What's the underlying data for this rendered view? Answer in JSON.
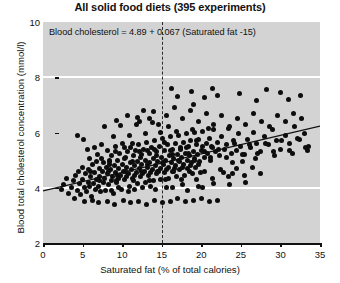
{
  "chart_data": {
    "type": "scatter",
    "title": "All solid food diets (395 experiments)",
    "xlabel": "Saturated fat (% of total calories)",
    "ylabel": "Blood total cholesterol concentration (mmol/l)",
    "xlim": [
      0,
      35
    ],
    "ylim": [
      2,
      10
    ],
    "xticks": [
      0,
      5,
      10,
      15,
      20,
      25,
      30,
      35
    ],
    "yticks": [
      2,
      4,
      6,
      8,
      10
    ],
    "gridlines_y": [
      4,
      8
    ],
    "grid": "horizontal-white",
    "legend": "none",
    "n_points": 395,
    "annotation": "Blood cholesterol = 4.89 + 0.067 (Saturated fat -15)",
    "regression": {
      "intercept_at_15": 4.89,
      "slope": 0.067,
      "x_start": 0,
      "y_start": 3.885,
      "x_end": 35,
      "y_end": 6.23
    },
    "reference_line": {
      "orientation": "vertical",
      "x": 15,
      "style": "dashed"
    },
    "point_color": "#0d0d0d",
    "plot_background": "#d3d3d3",
    "gridline_color": "#ffffff",
    "points": [
      [
        2.3,
        3.95
      ],
      [
        2.6,
        4.1
      ],
      [
        3.0,
        4.35
      ],
      [
        3.2,
        3.8
      ],
      [
        3.6,
        4.0
      ],
      [
        3.9,
        4.25
      ],
      [
        4.0,
        3.6
      ],
      [
        4.1,
        4.45
      ],
      [
        4.3,
        3.9
      ],
      [
        4.5,
        4.6
      ],
      [
        4.6,
        4.15
      ],
      [
        4.8,
        3.75
      ],
      [
        5.0,
        4.3
      ],
      [
        5.1,
        5.75
      ],
      [
        5.2,
        4.0
      ],
      [
        5.4,
        4.5
      ],
      [
        5.5,
        3.85
      ],
      [
        5.7,
        4.2
      ],
      [
        5.8,
        4.65
      ],
      [
        5.9,
        4.05
      ],
      [
        6.0,
        4.4
      ],
      [
        6.1,
        3.7
      ],
      [
        6.3,
        4.85
      ],
      [
        6.4,
        4.15
      ],
      [
        6.5,
        4.55
      ],
      [
        6.6,
        3.95
      ],
      [
        6.8,
        4.3
      ],
      [
        6.9,
        5.2
      ],
      [
        7.0,
        4.05
      ],
      [
        7.1,
        4.7
      ],
      [
        7.2,
        4.4
      ],
      [
        7.3,
        3.85
      ],
      [
        7.4,
        5.05
      ],
      [
        7.5,
        4.6
      ],
      [
        7.6,
        4.2
      ],
      [
        7.7,
        4.9
      ],
      [
        7.8,
        4.35
      ],
      [
        7.9,
        3.9
      ],
      [
        8.0,
        4.75
      ],
      [
        8.1,
        5.35
      ],
      [
        8.2,
        4.5
      ],
      [
        8.3,
        4.1
      ],
      [
        8.4,
        4.95
      ],
      [
        8.5,
        4.65
      ],
      [
        8.6,
        4.25
      ],
      [
        8.7,
        5.15
      ],
      [
        8.8,
        4.4
      ],
      [
        8.9,
        3.8
      ],
      [
        9.0,
        4.8
      ],
      [
        9.1,
        5.5
      ],
      [
        9.2,
        4.55
      ],
      [
        9.3,
        4.2
      ],
      [
        9.4,
        5.0
      ],
      [
        9.5,
        4.7
      ],
      [
        9.6,
        4.35
      ],
      [
        9.7,
        5.25
      ],
      [
        9.8,
        4.45
      ],
      [
        9.9,
        3.95
      ],
      [
        10.0,
        4.85
      ],
      [
        10.1,
        5.6
      ],
      [
        10.2,
        4.6
      ],
      [
        10.3,
        4.3
      ],
      [
        10.4,
        5.1
      ],
      [
        10.5,
        4.75
      ],
      [
        10.6,
        4.4
      ],
      [
        10.7,
        5.3
      ],
      [
        10.8,
        4.5
      ],
      [
        10.9,
        4.05
      ],
      [
        11.0,
        4.9
      ],
      [
        11.1,
        5.45
      ],
      [
        11.2,
        4.65
      ],
      [
        11.3,
        4.35
      ],
      [
        11.4,
        5.15
      ],
      [
        11.5,
        4.8
      ],
      [
        11.6,
        4.45
      ],
      [
        11.7,
        5.35
      ],
      [
        11.8,
        4.55
      ],
      [
        11.9,
        4.15
      ],
      [
        12.0,
        4.95
      ],
      [
        12.1,
        5.55
      ],
      [
        12.2,
        4.7
      ],
      [
        12.3,
        4.4
      ],
      [
        12.4,
        5.2
      ],
      [
        12.5,
        4.85
      ],
      [
        12.6,
        4.5
      ],
      [
        12.7,
        5.4
      ],
      [
        12.8,
        4.6
      ],
      [
        12.9,
        4.2
      ],
      [
        13.0,
        5.0
      ],
      [
        13.1,
        5.65
      ],
      [
        13.2,
        4.75
      ],
      [
        13.3,
        4.45
      ],
      [
        13.4,
        5.25
      ],
      [
        13.5,
        4.9
      ],
      [
        13.6,
        4.55
      ],
      [
        13.7,
        5.45
      ],
      [
        13.8,
        4.65
      ],
      [
        13.9,
        4.25
      ],
      [
        14.0,
        5.05
      ],
      [
        14.1,
        5.7
      ],
      [
        14.2,
        4.8
      ],
      [
        14.3,
        4.5
      ],
      [
        14.4,
        5.3
      ],
      [
        14.5,
        4.95
      ],
      [
        14.6,
        4.6
      ],
      [
        14.7,
        5.5
      ],
      [
        14.8,
        4.7
      ],
      [
        14.9,
        4.3
      ],
      [
        15.0,
        5.1
      ],
      [
        15.1,
        5.8
      ],
      [
        15.2,
        4.85
      ],
      [
        15.3,
        4.55
      ],
      [
        15.4,
        5.35
      ],
      [
        15.5,
        5.0
      ],
      [
        15.6,
        4.65
      ],
      [
        15.7,
        5.55
      ],
      [
        15.8,
        4.75
      ],
      [
        15.9,
        4.35
      ],
      [
        16.0,
        5.15
      ],
      [
        16.1,
        5.85
      ],
      [
        16.2,
        4.9
      ],
      [
        16.3,
        4.6
      ],
      [
        16.4,
        5.4
      ],
      [
        16.5,
        5.05
      ],
      [
        16.6,
        4.7
      ],
      [
        16.7,
        5.6
      ],
      [
        16.8,
        4.8
      ],
      [
        16.9,
        4.4
      ],
      [
        17.0,
        5.2
      ],
      [
        17.1,
        5.9
      ],
      [
        17.2,
        4.95
      ],
      [
        17.3,
        4.65
      ],
      [
        17.4,
        5.45
      ],
      [
        17.5,
        5.1
      ],
      [
        17.6,
        4.75
      ],
      [
        17.7,
        5.65
      ],
      [
        17.8,
        4.85
      ],
      [
        17.9,
        4.45
      ],
      [
        18.0,
        5.25
      ],
      [
        18.1,
        5.95
      ],
      [
        18.2,
        5.0
      ],
      [
        18.3,
        4.7
      ],
      [
        18.4,
        5.5
      ],
      [
        18.5,
        5.15
      ],
      [
        18.6,
        4.8
      ],
      [
        18.7,
        5.7
      ],
      [
        18.8,
        4.9
      ],
      [
        18.9,
        4.5
      ],
      [
        19.0,
        5.3
      ],
      [
        19.1,
        6.0
      ],
      [
        19.2,
        5.05
      ],
      [
        19.3,
        4.75
      ],
      [
        19.4,
        5.55
      ],
      [
        19.5,
        5.2
      ],
      [
        19.6,
        4.85
      ],
      [
        19.7,
        5.75
      ],
      [
        19.8,
        4.95
      ],
      [
        19.9,
        4.55
      ],
      [
        20.0,
        5.35
      ],
      [
        20.2,
        6.05
      ],
      [
        20.4,
        5.1
      ],
      [
        20.6,
        5.6
      ],
      [
        20.8,
        5.25
      ],
      [
        21.0,
        5.8
      ],
      [
        21.2,
        5.0
      ],
      [
        21.4,
        5.45
      ],
      [
        21.6,
        6.1
      ],
      [
        21.8,
        5.3
      ],
      [
        22.0,
        5.65
      ],
      [
        22.3,
        5.15
      ],
      [
        22.6,
        5.85
      ],
      [
        22.9,
        5.4
      ],
      [
        23.2,
        5.55
      ],
      [
        23.5,
        6.15
      ],
      [
        23.8,
        5.25
      ],
      [
        24.1,
        5.7
      ],
      [
        24.4,
        5.35
      ],
      [
        24.7,
        5.95
      ],
      [
        25.0,
        5.5
      ],
      [
        25.4,
        5.2
      ],
      [
        25.8,
        5.75
      ],
      [
        26.2,
        5.45
      ],
      [
        26.6,
        6.0
      ],
      [
        27.0,
        5.6
      ],
      [
        27.5,
        5.3
      ],
      [
        28.0,
        5.85
      ],
      [
        28.5,
        5.55
      ],
      [
        29.0,
        6.1
      ],
      [
        29.5,
        5.7
      ],
      [
        30.0,
        5.4
      ],
      [
        30.6,
        5.9
      ],
      [
        31.2,
        5.6
      ],
      [
        31.8,
        6.2
      ],
      [
        32.4,
        5.75
      ],
      [
        33.0,
        5.95
      ],
      [
        33.6,
        5.5
      ],
      [
        5.3,
        3.5
      ],
      [
        6.2,
        3.55
      ],
      [
        7.05,
        3.45
      ],
      [
        8.15,
        3.5
      ],
      [
        9.05,
        3.4
      ],
      [
        10.15,
        3.55
      ],
      [
        11.05,
        3.45
      ],
      [
        12.05,
        3.5
      ],
      [
        13.05,
        3.4
      ],
      [
        14.05,
        3.55
      ],
      [
        15.05,
        3.45
      ],
      [
        16.05,
        3.5
      ],
      [
        17.05,
        3.6
      ],
      [
        18.05,
        3.5
      ],
      [
        19.05,
        3.55
      ],
      [
        20.05,
        3.6
      ],
      [
        21.05,
        3.5
      ],
      [
        22.05,
        3.55
      ],
      [
        4.4,
        5.9
      ],
      [
        5.6,
        5.4
      ],
      [
        12.2,
        6.4
      ],
      [
        13.4,
        6.5
      ],
      [
        14.6,
        6.3
      ],
      [
        15.6,
        6.6
      ],
      [
        16.6,
        6.9
      ],
      [
        17.6,
        6.5
      ],
      [
        18.6,
        6.8
      ],
      [
        19.6,
        6.4
      ],
      [
        20.6,
        6.7
      ],
      [
        21.6,
        6.3
      ],
      [
        22.6,
        6.6
      ],
      [
        23.6,
        6.2
      ],
      [
        24.6,
        6.5
      ],
      [
        25.6,
        6.3
      ],
      [
        26.6,
        6.7
      ],
      [
        27.6,
        6.4
      ],
      [
        28.6,
        6.2
      ],
      [
        29.6,
        6.6
      ],
      [
        30.6,
        6.4
      ],
      [
        31.6,
        6.7
      ],
      [
        32.6,
        6.5
      ],
      [
        17.0,
        7.3
      ],
      [
        18.8,
        7.5
      ],
      [
        19.0,
        7.0
      ],
      [
        20.4,
        7.25
      ],
      [
        22.0,
        7.35
      ],
      [
        24.8,
        7.4
      ],
      [
        27.0,
        7.15
      ],
      [
        30.0,
        7.45
      ],
      [
        31.0,
        7.2
      ],
      [
        32.5,
        7.35
      ],
      [
        16.2,
        7.6
      ],
      [
        21.4,
        7.6
      ],
      [
        28.2,
        7.55
      ],
      [
        6.7,
        4.95
      ],
      [
        7.45,
        5.55
      ],
      [
        8.35,
        5.0
      ],
      [
        9.15,
        5.3
      ],
      [
        10.25,
        5.05
      ],
      [
        11.35,
        5.6
      ],
      [
        12.35,
        5.1
      ],
      [
        13.25,
        5.35
      ],
      [
        14.35,
        5.15
      ],
      [
        15.35,
        5.65
      ],
      [
        16.35,
        5.2
      ],
      [
        17.35,
        5.4
      ],
      [
        18.35,
        5.25
      ],
      [
        19.35,
        5.7
      ],
      [
        20.35,
        5.3
      ],
      [
        21.35,
        5.5
      ],
      [
        6.05,
        4.6
      ],
      [
        7.15,
        4.25
      ],
      [
        8.25,
        4.6
      ],
      [
        9.35,
        4.25
      ],
      [
        10.45,
        4.6
      ],
      [
        11.45,
        4.25
      ],
      [
        12.45,
        4.6
      ],
      [
        13.45,
        4.25
      ],
      [
        14.45,
        4.6
      ],
      [
        15.45,
        4.3
      ],
      [
        16.45,
        4.6
      ],
      [
        17.45,
        4.3
      ],
      [
        18.45,
        4.6
      ],
      [
        19.45,
        4.3
      ],
      [
        20.45,
        4.6
      ],
      [
        21.45,
        4.35
      ],
      [
        22.45,
        4.65
      ],
      [
        23.45,
        4.4
      ],
      [
        24.45,
        4.7
      ],
      [
        25.45,
        4.45
      ],
      [
        26.45,
        4.75
      ],
      [
        27.45,
        4.5
      ],
      [
        9.6,
        4.0
      ],
      [
        11.6,
        3.95
      ],
      [
        13.6,
        4.05
      ],
      [
        15.6,
        4.0
      ],
      [
        17.6,
        4.1
      ],
      [
        19.6,
        4.05
      ],
      [
        21.6,
        4.15
      ],
      [
        23.6,
        4.1
      ],
      [
        25.6,
        4.2
      ],
      [
        8.9,
        5.85
      ],
      [
        10.9,
        5.9
      ],
      [
        12.9,
        5.95
      ],
      [
        14.9,
        6.0
      ],
      [
        16.9,
        6.05
      ],
      [
        18.9,
        6.1
      ],
      [
        20.9,
        6.15
      ],
      [
        7.8,
        6.2
      ],
      [
        9.8,
        6.25
      ],
      [
        11.8,
        6.3
      ],
      [
        13.8,
        6.35
      ],
      [
        15.8,
        6.2
      ],
      [
        5.05,
        4.75
      ],
      [
        5.85,
        5.05
      ],
      [
        6.55,
        5.45
      ],
      [
        8.45,
        4.85
      ],
      [
        9.45,
        4.45
      ],
      [
        10.35,
        5.45
      ],
      [
        11.25,
        4.95
      ],
      [
        12.15,
        5.3
      ],
      [
        13.15,
        4.85
      ],
      [
        14.15,
        5.4
      ],
      [
        15.15,
        4.9
      ],
      [
        16.15,
        5.35
      ],
      [
        17.15,
        5.0
      ],
      [
        18.15,
        5.45
      ],
      [
        19.15,
        5.0
      ],
      [
        20.15,
        5.5
      ],
      [
        21.15,
        5.1
      ],
      [
        22.15,
        5.4
      ],
      [
        23.15,
        5.1
      ],
      [
        24.15,
        5.6
      ],
      [
        25.15,
        5.2
      ],
      [
        26.15,
        5.55
      ],
      [
        27.15,
        5.25
      ],
      [
        28.15,
        5.6
      ],
      [
        29.15,
        5.3
      ],
      [
        30.15,
        5.7
      ],
      [
        31.15,
        5.35
      ],
      [
        32.15,
        5.8
      ],
      [
        33.15,
        5.45
      ],
      [
        12.6,
        4.0
      ],
      [
        14.2,
        3.95
      ],
      [
        16.4,
        4.0
      ],
      [
        18.2,
        3.9
      ],
      [
        20.2,
        4.0
      ],
      [
        10.8,
        3.85
      ],
      [
        8.6,
        3.9
      ],
      [
        24.0,
        4.9
      ],
      [
        25.2,
        4.95
      ],
      [
        26.8,
        5.05
      ],
      [
        29.2,
        5.15
      ],
      [
        31.5,
        5.25
      ],
      [
        33.4,
        5.35
      ],
      [
        11.9,
        6.55
      ],
      [
        12.7,
        6.8
      ],
      [
        13.9,
        6.75
      ],
      [
        9.3,
        6.45
      ],
      [
        10.7,
        6.6
      ],
      [
        22.8,
        4.55
      ],
      [
        23.9,
        4.5
      ]
    ]
  }
}
